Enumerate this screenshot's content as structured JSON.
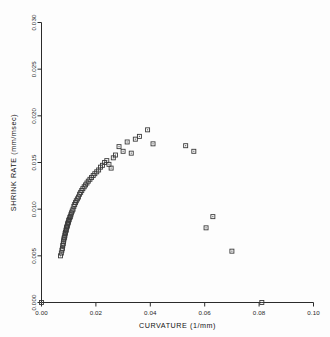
{
  "figure": {
    "background": "#fdfdfd",
    "marker_color": "#3a3a3a",
    "axis_color": "#2b2b2b"
  },
  "axes": {
    "x_title": "CURVATURE (1/mm)",
    "y_title": "SHRINK RATE (mm/msec)",
    "x_ticklabels": [
      "0.00",
      "0.02",
      "0.04",
      "0.06",
      "0.08",
      "0.10"
    ],
    "y_ticklabels": [
      "0.000",
      "0.005",
      "0.010",
      "0.015",
      "0.020",
      "0.025",
      "0.030"
    ]
  },
  "chart_data": {
    "type": "scatter",
    "title": "",
    "xlabel": "CURVATURE (1/mm)",
    "ylabel": "SHRINK RATE (mm/msec)",
    "xlim": [
      0.0,
      0.1
    ],
    "ylim": [
      0.0,
      0.03
    ],
    "xticks": [
      0.0,
      0.02,
      0.04,
      0.06,
      0.08,
      0.1
    ],
    "yticks": [
      0.0,
      0.005,
      0.01,
      0.015,
      0.02,
      0.025,
      0.03
    ],
    "grid": false,
    "legend": null,
    "marker": "square-open",
    "series": [
      {
        "name": "shrink rate vs curvature",
        "points": [
          [
            0.0,
            0.0
          ],
          [
            0.007,
            0.005
          ],
          [
            0.0073,
            0.0053
          ],
          [
            0.0075,
            0.0056
          ],
          [
            0.0077,
            0.0058
          ],
          [
            0.0078,
            0.0061
          ],
          [
            0.008,
            0.0063
          ],
          [
            0.0081,
            0.0065
          ],
          [
            0.0082,
            0.0067
          ],
          [
            0.0083,
            0.0069
          ],
          [
            0.0085,
            0.007
          ],
          [
            0.0086,
            0.0072
          ],
          [
            0.0087,
            0.0074
          ],
          [
            0.0088,
            0.0075
          ],
          [
            0.009,
            0.0077
          ],
          [
            0.0091,
            0.0078
          ],
          [
            0.0092,
            0.008
          ],
          [
            0.0093,
            0.0081
          ],
          [
            0.0095,
            0.0082
          ],
          [
            0.0096,
            0.0084
          ],
          [
            0.0097,
            0.0085
          ],
          [
            0.0099,
            0.0086
          ],
          [
            0.01,
            0.0088
          ],
          [
            0.0102,
            0.0089
          ],
          [
            0.0104,
            0.0091
          ],
          [
            0.0106,
            0.0092
          ],
          [
            0.0108,
            0.0094
          ],
          [
            0.011,
            0.0096
          ],
          [
            0.0113,
            0.0098
          ],
          [
            0.0116,
            0.01
          ],
          [
            0.0119,
            0.0103
          ],
          [
            0.0122,
            0.0105
          ],
          [
            0.0125,
            0.0107
          ],
          [
            0.0128,
            0.0109
          ],
          [
            0.0132,
            0.0111
          ],
          [
            0.0136,
            0.0113
          ],
          [
            0.014,
            0.0116
          ],
          [
            0.0144,
            0.0118
          ],
          [
            0.0148,
            0.012
          ],
          [
            0.0152,
            0.0122
          ],
          [
            0.0157,
            0.0124
          ],
          [
            0.0162,
            0.0126
          ],
          [
            0.0167,
            0.0128
          ],
          [
            0.0172,
            0.013
          ],
          [
            0.0178,
            0.0132
          ],
          [
            0.0184,
            0.0134
          ],
          [
            0.019,
            0.0136
          ],
          [
            0.0196,
            0.0138
          ],
          [
            0.0203,
            0.014
          ],
          [
            0.021,
            0.0142
          ],
          [
            0.0217,
            0.0145
          ],
          [
            0.0224,
            0.0147
          ],
          [
            0.0232,
            0.015
          ],
          [
            0.024,
            0.0152
          ],
          [
            0.0248,
            0.0148
          ],
          [
            0.0256,
            0.0144
          ],
          [
            0.0264,
            0.0155
          ],
          [
            0.0272,
            0.0158
          ],
          [
            0.0285,
            0.0167
          ],
          [
            0.03,
            0.0162
          ],
          [
            0.0315,
            0.0172
          ],
          [
            0.033,
            0.016
          ],
          [
            0.0345,
            0.0175
          ],
          [
            0.036,
            0.0178
          ],
          [
            0.039,
            0.0185
          ],
          [
            0.041,
            0.017
          ],
          [
            0.053,
            0.0168
          ],
          [
            0.056,
            0.0162
          ],
          [
            0.063,
            0.0092
          ],
          [
            0.0605,
            0.008
          ],
          [
            0.07,
            0.0055
          ],
          [
            0.081,
            0.0
          ]
        ]
      }
    ]
  }
}
